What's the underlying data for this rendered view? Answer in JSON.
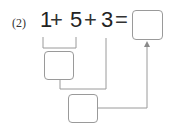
{
  "problem": {
    "label": "(2)",
    "terms": [
      "1",
      "+",
      "5",
      "+",
      "3",
      "="
    ],
    "answer_box": "",
    "step1_box": "",
    "step2_box": ""
  },
  "colors": {
    "line": "#9a9a9a",
    "text": "#222222"
  }
}
